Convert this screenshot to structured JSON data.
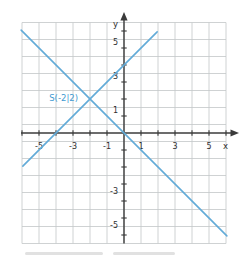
{
  "figure": {
    "background_color": "#ffffff",
    "grid_color": "#c3c6c8",
    "axis_color": "#3b3b3b",
    "tick_label_color": "#2e2e2e",
    "line_color": "#62abd8",
    "point_label_color": "#3f9ad2"
  },
  "chart_data": {
    "type": "line",
    "title": "",
    "xlabel": "x",
    "ylabel": "y",
    "xlim": [
      -6,
      6
    ],
    "ylim": [
      -6.5,
      6.5
    ],
    "grid": true,
    "x_ticks_every": 1,
    "y_ticks_every": 1,
    "x_tick_labels": [
      {
        "value": -5,
        "label": "-5"
      },
      {
        "value": -3,
        "label": "-3"
      },
      {
        "value": -1,
        "label": "-1"
      },
      {
        "value": 1,
        "label": "1"
      },
      {
        "value": 3,
        "label": "3"
      },
      {
        "value": 5,
        "label": "5"
      }
    ],
    "y_tick_labels": [
      {
        "value": 5,
        "label": "5"
      },
      {
        "value": 3,
        "label": "3"
      },
      {
        "value": 1,
        "label": "1"
      },
      {
        "value": -3,
        "label": "-3"
      },
      {
        "value": -5,
        "label": "-5"
      }
    ],
    "series": [
      {
        "name": "rising-line",
        "equation": "y = x + 4",
        "slope": 1,
        "y_intercept": 4,
        "endpoints": [
          [
            -5.95,
            -1.95
          ],
          [
            1.95,
            5.95
          ]
        ]
      },
      {
        "name": "falling-line",
        "equation": "y = -x",
        "slope": -1,
        "y_intercept": 0,
        "endpoints": [
          [
            -6.05,
            6.05
          ],
          [
            6.05,
            -6.05
          ]
        ]
      }
    ],
    "intersection_point": {
      "x": -2,
      "y": 2,
      "label": "S(-2|2)"
    }
  }
}
